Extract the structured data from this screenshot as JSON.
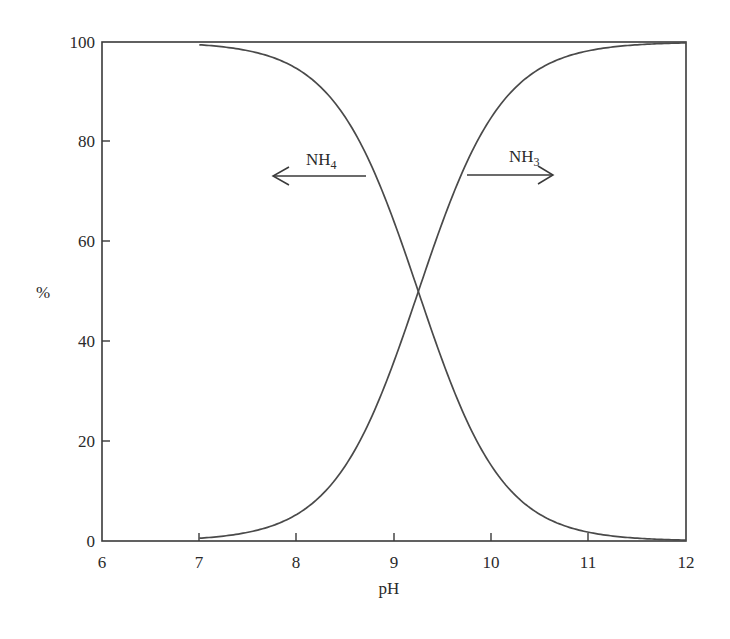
{
  "chart_data": {
    "type": "line",
    "title": "",
    "xlabel": "pH",
    "ylabel": "%",
    "xlim": [
      6,
      12
    ],
    "ylim": [
      0,
      100
    ],
    "xticks": [
      6,
      7,
      8,
      9,
      10,
      11,
      12
    ],
    "yticks": [
      0,
      20,
      40,
      60,
      80,
      100
    ],
    "grid": false,
    "legend": "none (inline annotations with arrows)",
    "x": [
      7.0,
      7.5,
      8.0,
      8.25,
      8.5,
      8.75,
      9.0,
      9.25,
      9.5,
      9.75,
      10.0,
      10.5,
      11.0,
      11.5,
      12.0
    ],
    "series": [
      {
        "name": "NH4",
        "values": [
          99.4,
          98.3,
          94.6,
          90.8,
          84.6,
          75.5,
          63.5,
          50.0,
          36.5,
          24.5,
          15.4,
          5.4,
          1.7,
          0.6,
          0.2
        ]
      },
      {
        "name": "NH3",
        "values": [
          0.6,
          1.7,
          5.4,
          9.2,
          15.4,
          24.5,
          36.5,
          50.0,
          63.5,
          75.5,
          84.6,
          94.6,
          98.3,
          99.4,
          99.8
        ]
      }
    ],
    "annotations": [
      {
        "text": "NH4",
        "subscript": "4",
        "arrow": "left",
        "position": {
          "x": 8.6,
          "y": 73
        }
      },
      {
        "text": "NH3",
        "subscript": "3",
        "arrow": "right",
        "position": {
          "x": 10.2,
          "y": 73
        }
      }
    ],
    "crossover": {
      "x": 9.25,
      "y": 50
    }
  },
  "labels": {
    "y_axis_title": "%",
    "x_axis_title": "pH",
    "nh4_main": "NH",
    "nh4_sub": "4",
    "nh3_main": "NH",
    "nh3_sub": "3"
  },
  "ticks": {
    "x": [
      "6",
      "7",
      "8",
      "9",
      "10",
      "11",
      "12"
    ],
    "y": [
      "0",
      "20",
      "40",
      "60",
      "80",
      "100"
    ]
  },
  "colors": {
    "line": "#4a4a4a",
    "axis": "#3a3a3a",
    "background": "#ffffff"
  }
}
